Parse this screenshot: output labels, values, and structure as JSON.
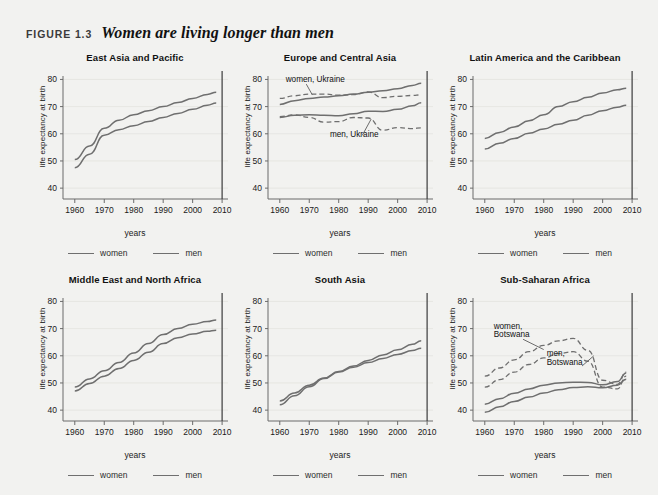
{
  "figure": {
    "label": "FIGURE 1.3",
    "title": "Women are living longer than men",
    "background": "#f2f2f0",
    "line_color": "#6f6f6f"
  },
  "legend": {
    "women": "women",
    "men": "men"
  },
  "axes": {
    "xlabel": "years",
    "ylabel": "life expectancy at birth",
    "xticks": [
      1960,
      1970,
      1980,
      1990,
      2000,
      2010
    ],
    "yticks": [
      40,
      50,
      60,
      70,
      80
    ],
    "xlim": [
      1956,
      2012
    ],
    "ylim": [
      36,
      82
    ]
  },
  "chart_data": [
    {
      "type": "line",
      "title": "East Asia and Pacific",
      "xlabel": "years",
      "ylabel": "life expectancy at birth",
      "xlim": [
        1956,
        2012
      ],
      "ylim": [
        36,
        82
      ],
      "grid": true,
      "legend_position": "bottom",
      "x": [
        1960,
        1965,
        1970,
        1975,
        1980,
        1985,
        1990,
        1995,
        2000,
        2005,
        2008
      ],
      "series": [
        {
          "name": "women",
          "style": "solid",
          "values": [
            50.5,
            55.5,
            62.0,
            65.0,
            67.0,
            68.5,
            70.0,
            71.5,
            73.0,
            74.5,
            75.3
          ]
        },
        {
          "name": "men",
          "style": "solid",
          "values": [
            47.5,
            52.5,
            59.5,
            61.5,
            63.0,
            64.5,
            66.0,
            67.5,
            69.0,
            70.5,
            71.3
          ]
        }
      ]
    },
    {
      "type": "line",
      "title": "Europe and Central Asia",
      "xlabel": "years",
      "ylabel": "life expectancy at birth",
      "xlim": [
        1956,
        2012
      ],
      "ylim": [
        36,
        82
      ],
      "grid": true,
      "legend_position": "bottom",
      "x": [
        1960,
        1965,
        1970,
        1975,
        1980,
        1985,
        1990,
        1995,
        2000,
        2005,
        2008
      ],
      "series": [
        {
          "name": "women",
          "style": "solid",
          "values": [
            70.8,
            72.2,
            73.0,
            73.5,
            74.0,
            74.6,
            75.3,
            75.8,
            76.6,
            77.8,
            78.6
          ]
        },
        {
          "name": "men",
          "style": "solid",
          "values": [
            66.0,
            66.8,
            67.0,
            66.8,
            66.6,
            67.4,
            68.3,
            68.2,
            69.0,
            70.3,
            71.4
          ]
        },
        {
          "name": "women, Ukraine",
          "style": "dashed",
          "values": [
            73.0,
            74.0,
            74.6,
            74.6,
            74.2,
            74.4,
            75.4,
            73.3,
            73.8,
            74.1,
            74.3
          ]
        },
        {
          "name": "men, Ukraine",
          "style": "dashed",
          "values": [
            66.3,
            67.0,
            66.0,
            64.3,
            64.5,
            66.0,
            65.8,
            61.3,
            62.3,
            61.9,
            62.2
          ]
        }
      ],
      "annotations": [
        {
          "text": "women, Ukraine",
          "x": 1962,
          "y": 79.0
        },
        {
          "text": "men, Ukraine",
          "x": 1977,
          "y": 58.7
        }
      ]
    },
    {
      "type": "line",
      "title": "Latin America and the Caribbean",
      "xlabel": "years",
      "ylabel": "life expectancy at birth",
      "xlim": [
        1956,
        2012
      ],
      "ylim": [
        36,
        82
      ],
      "grid": true,
      "legend_position": "bottom",
      "x": [
        1960,
        1965,
        1970,
        1975,
        1980,
        1985,
        1990,
        1995,
        2000,
        2005,
        2008
      ],
      "series": [
        {
          "name": "women",
          "style": "solid",
          "values": [
            58.3,
            60.5,
            62.5,
            64.8,
            67.0,
            70.0,
            71.8,
            73.4,
            75.0,
            76.2,
            76.8
          ]
        },
        {
          "name": "men",
          "style": "solid",
          "values": [
            54.4,
            56.5,
            58.3,
            60.2,
            61.8,
            63.5,
            65.0,
            66.8,
            68.5,
            69.8,
            70.5
          ]
        }
      ]
    },
    {
      "type": "line",
      "title": "Middle East and North Africa",
      "xlabel": "years",
      "ylabel": "life expectancy at birth",
      "xlim": [
        1956,
        2012
      ],
      "ylim": [
        36,
        82
      ],
      "grid": true,
      "legend_position": "bottom",
      "x": [
        1960,
        1965,
        1970,
        1975,
        1980,
        1985,
        1990,
        1995,
        2000,
        2005,
        2008
      ],
      "series": [
        {
          "name": "women",
          "style": "solid",
          "values": [
            48.5,
            51.5,
            54.5,
            57.5,
            61.0,
            64.5,
            67.8,
            70.0,
            71.6,
            72.6,
            73.2
          ]
        },
        {
          "name": "men",
          "style": "solid",
          "values": [
            47.0,
            49.8,
            52.5,
            55.3,
            58.3,
            61.3,
            64.5,
            66.6,
            68.0,
            69.0,
            69.4
          ]
        }
      ]
    },
    {
      "type": "line",
      "title": "South Asia",
      "xlabel": "years",
      "ylabel": "life expectancy at birth",
      "xlim": [
        1956,
        2012
      ],
      "ylim": [
        36,
        82
      ],
      "grid": true,
      "legend_position": "bottom",
      "x": [
        1960,
        1965,
        1970,
        1975,
        1980,
        1985,
        1990,
        1995,
        2000,
        2005,
        2008
      ],
      "series": [
        {
          "name": "women",
          "style": "solid",
          "values": [
            43.4,
            46.3,
            49.2,
            51.8,
            54.2,
            56.2,
            58.3,
            60.3,
            62.2,
            64.2,
            65.5
          ]
        },
        {
          "name": "men",
          "style": "solid",
          "values": [
            42.0,
            45.3,
            48.6,
            51.6,
            54.0,
            55.8,
            57.5,
            59.0,
            60.5,
            61.9,
            62.8
          ]
        }
      ]
    },
    {
      "type": "line",
      "title": "Sub-Saharan Africa",
      "xlabel": "years",
      "ylabel": "life expectancy at birth",
      "xlim": [
        1956,
        2012
      ],
      "ylim": [
        36,
        82
      ],
      "grid": true,
      "legend_position": "bottom",
      "x": [
        1960,
        1965,
        1970,
        1975,
        1980,
        1985,
        1990,
        1995,
        2000,
        2005,
        2008
      ],
      "series": [
        {
          "name": "women",
          "style": "solid",
          "values": [
            42.2,
            44.2,
            46.2,
            47.8,
            49.2,
            50.0,
            50.3,
            50.2,
            49.3,
            50.5,
            53.7
          ]
        },
        {
          "name": "men",
          "style": "solid",
          "values": [
            39.2,
            41.2,
            43.2,
            44.8,
            46.3,
            47.5,
            48.3,
            48.6,
            48.2,
            49.2,
            51.4
          ]
        },
        {
          "name": "women, Botswana",
          "style": "dashed",
          "values": [
            52.5,
            55.5,
            58.5,
            61.5,
            63.8,
            65.5,
            66.4,
            62.0,
            51.0,
            49.5,
            54.0
          ]
        },
        {
          "name": "men, Botswana",
          "style": "dashed",
          "values": [
            48.5,
            51.2,
            54.0,
            56.8,
            59.2,
            60.8,
            61.5,
            58.0,
            48.5,
            47.8,
            52.5
          ]
        }
      ],
      "annotations": [
        {
          "text": "women,",
          "x": 1963,
          "y": 70.0
        },
        {
          "text": "Botswana",
          "x": 1963,
          "y": 66.8
        },
        {
          "text": "men,",
          "x": 1981,
          "y": 59.8
        },
        {
          "text": "Botswana",
          "x": 1981,
          "y": 56.6
        }
      ]
    }
  ]
}
